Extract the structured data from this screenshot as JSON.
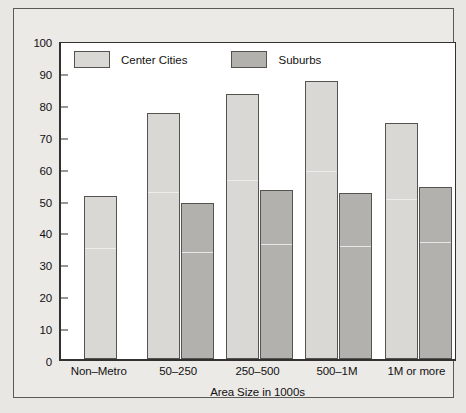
{
  "chart_data": {
    "type": "bar",
    "title": "",
    "xlabel": "Area Size in 1000s",
    "ylabel": "",
    "ylim": [
      0,
      100
    ],
    "ytick_step": 10,
    "yticks": [
      0,
      10,
      20,
      30,
      40,
      50,
      60,
      70,
      80,
      90,
      100
    ],
    "grid": false,
    "legend_position": "top-left-inside",
    "categories": [
      "Non–Metro",
      "50–250",
      "250–500",
      "500–1M",
      "1M or more"
    ],
    "series": [
      {
        "name": "Center Cities",
        "color": "#d9d8d4",
        "values": [
          51,
          77,
          83,
          87,
          74
        ]
      },
      {
        "name": "Suburbs",
        "color": "#b2b1ad",
        "values": [
          null,
          49,
          53,
          52,
          54
        ]
      }
    ]
  },
  "legend": {
    "items": [
      {
        "label": "Center Cities",
        "swatch": "center-cities-swatch"
      },
      {
        "label": "Suburbs",
        "swatch": "suburbs-swatch"
      }
    ]
  },
  "axes": {
    "x_title": "Area Size in 1000s",
    "y_tick_labels": [
      "100",
      "90",
      "80",
      "70",
      "60",
      "50",
      "40",
      "30",
      "20",
      "10",
      "0"
    ],
    "x_tick_labels": [
      "Non–Metro",
      "50–250",
      "250–500",
      "500–1M",
      "1M or more"
    ]
  },
  "colors": {
    "center_cities": "#d9d8d4",
    "suburbs": "#b2b1ad",
    "axis": "#33312f",
    "page_background": "#e9e7e4",
    "plot_background": "#ffffff"
  }
}
